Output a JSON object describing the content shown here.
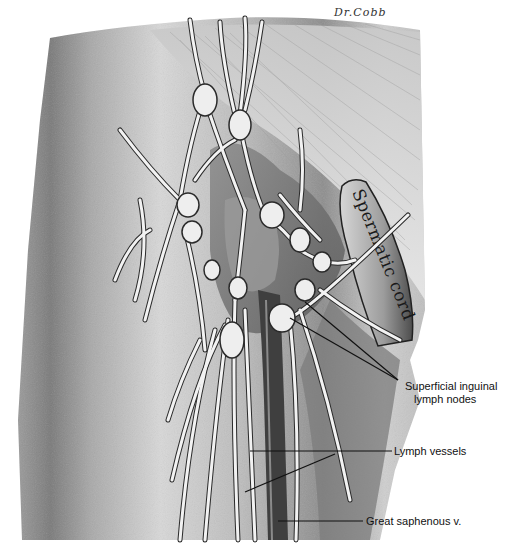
{
  "figure": {
    "signature": "Dr.Cobb",
    "structures": {
      "spermatic_cord": "Spermatic cord"
    },
    "labels": [
      {
        "id": "superficial-inguinal-lymph-nodes",
        "line1": "Superficial inguinal",
        "line2": "lymph nodes"
      },
      {
        "id": "lymph-vessels",
        "line1": "Lymph vessels"
      },
      {
        "id": "great-saphenous-vein",
        "line1": "Great saphenous v."
      }
    ],
    "colors": {
      "background": "#ffffff",
      "skin_light": "#e4e4e4",
      "skin_mid": "#bdbdbd",
      "skin_dark": "#6e6e6e",
      "vessel": "#f2f2f2",
      "vessel_outline": "#2a2a2a",
      "leader_line": "#111111"
    }
  }
}
